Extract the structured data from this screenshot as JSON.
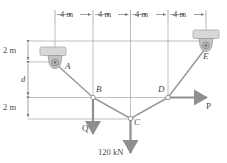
{
  "figure": {
    "colors": {
      "line": "#8a8a8a",
      "member": "#9a9a9a",
      "arrow": "#7a7a7a",
      "text": "#4a4a4a",
      "support_fill": "#d8d8d8",
      "support_edge": "#a8a8a8",
      "pulley_fill": "#bdbdbd",
      "joint_fill": "#ffffff"
    }
  },
  "top_dimensions": {
    "segments": [
      {
        "label": "4 m"
      },
      {
        "label": "4 m"
      },
      {
        "label": "4 m"
      },
      {
        "label": "4 m"
      }
    ]
  },
  "left_dimensions": {
    "segments": [
      {
        "label": "2 m"
      },
      {
        "label": "d"
      },
      {
        "label": "2 m"
      }
    ]
  },
  "joints": [
    {
      "id": "A",
      "label": "A"
    },
    {
      "id": "B",
      "label": "B"
    },
    {
      "id": "C",
      "label": "C"
    },
    {
      "id": "D",
      "label": "D"
    },
    {
      "id": "E",
      "label": "E"
    }
  ],
  "forces": [
    {
      "id": "Q",
      "label": "Q",
      "direction": "down"
    },
    {
      "id": "P",
      "label": "P",
      "direction": "right"
    },
    {
      "id": "load-120",
      "label": "120 kN",
      "direction": "down"
    }
  ]
}
